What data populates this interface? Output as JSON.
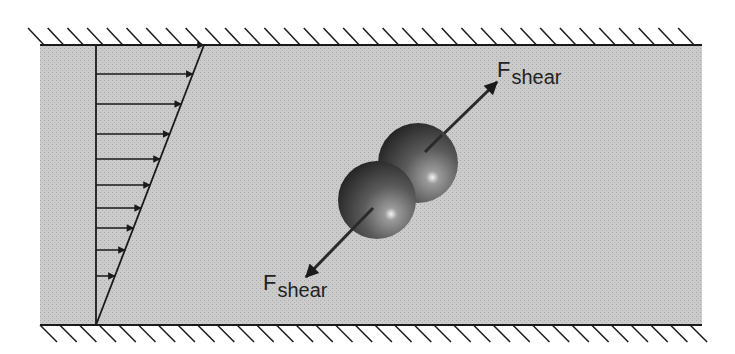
{
  "diagram": {
    "channel": {
      "x": 40,
      "top": 45,
      "bottom": 325,
      "right": 702,
      "fill": "#c9c9c9"
    },
    "velocity_profile": {
      "wall_x": 96,
      "arrow_ys": [
        45,
        74,
        104,
        134,
        159,
        185,
        208,
        228,
        250,
        276
      ],
      "line_from": [
        96,
        325
      ],
      "line_to": [
        204,
        45
      ]
    },
    "spheres": [
      {
        "cx": 377,
        "cy": 200,
        "r": 39
      },
      {
        "cx": 418,
        "cy": 163,
        "r": 40
      }
    ],
    "force_labels": {
      "top": {
        "main": "F",
        "sub": "shear"
      },
      "bottom": {
        "main": "F",
        "sub": "shear"
      }
    }
  }
}
